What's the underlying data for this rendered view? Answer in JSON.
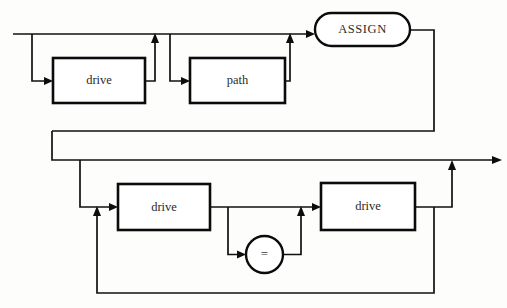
{
  "diagram": {
    "kind": "railroad-syntax-diagram",
    "canvas": {
      "width": 507,
      "height": 308
    },
    "background_color": "#fdfdfc",
    "line_color": "#111111",
    "box_fill": "#ffffff",
    "nodes": [
      {
        "id": "drive-top",
        "label": "drive",
        "shape": "rect",
        "x": 53,
        "y": 58,
        "width": 92,
        "height": 45,
        "cx": 99,
        "cy": 80.5
      },
      {
        "id": "path-top",
        "label": "path",
        "shape": "rect",
        "x": 190,
        "y": 58,
        "width": 95,
        "height": 45,
        "cx": 237.5,
        "cy": 80.5
      },
      {
        "id": "assign-terminal",
        "label": "ASSIGN",
        "shape": "stadium",
        "x": 315,
        "y": 13,
        "width": 95,
        "height": 33,
        "cx": 362.5,
        "cy": 29.5
      },
      {
        "id": "drive-mid-left",
        "label": "drive",
        "shape": "rect",
        "x": 118,
        "y": 184,
        "width": 92,
        "height": 46,
        "cx": 164,
        "cy": 207
      },
      {
        "id": "equals-operator",
        "label": "=",
        "shape": "circle",
        "cx": 264.5,
        "cy": 254.5,
        "r": 18.5
      },
      {
        "id": "drive-mid-right",
        "label": "drive",
        "shape": "rect",
        "x": 321,
        "y": 183,
        "width": 94,
        "height": 47,
        "cx": 368,
        "cy": 206.5
      }
    ],
    "labels": {
      "drive_top": "drive",
      "path_top": "path",
      "assign": "ASSIGN",
      "drive_mid_left": "drive",
      "equals": "=",
      "drive_mid_right": "drive"
    },
    "rails": {
      "top_entry_line": "from x=13 to x=312 at y=34",
      "top_drive_bypass": "down at x=32 to y=81, arrow right into drive",
      "top_drive_return": "right of drive to x=155, up to y=34 with arrow",
      "top_path_bypass": "down at x=170 to y=81, arrow right into path",
      "top_path_return": "right of path to x=290, up to y=34 with arrow",
      "assign_exit": "right to x=434, down to y=131, left to x=52",
      "band_left": "down at x=52 from y=131 to y=160",
      "band_bottom": "right from x=52 at y=160 to arrow at x=500",
      "mid_entry_drop": "down at x=80 from y=160 to y=207, arrow right into drive",
      "equals_branch": "down at x=228 from y=207 to y=254, arrow right into circle",
      "equals_return": "right of circle to x=301, up to y=207 with arrow",
      "mid_straight": "right of drive-mid-left at y=207 to arrow into drive-mid-right",
      "right_exit": "right of drive-mid-right to x=452, up to y=160 with arrow",
      "loop_back": "down at x=434 from y=207 to y=293, left to x=97, up with arrow to y=207"
    }
  }
}
